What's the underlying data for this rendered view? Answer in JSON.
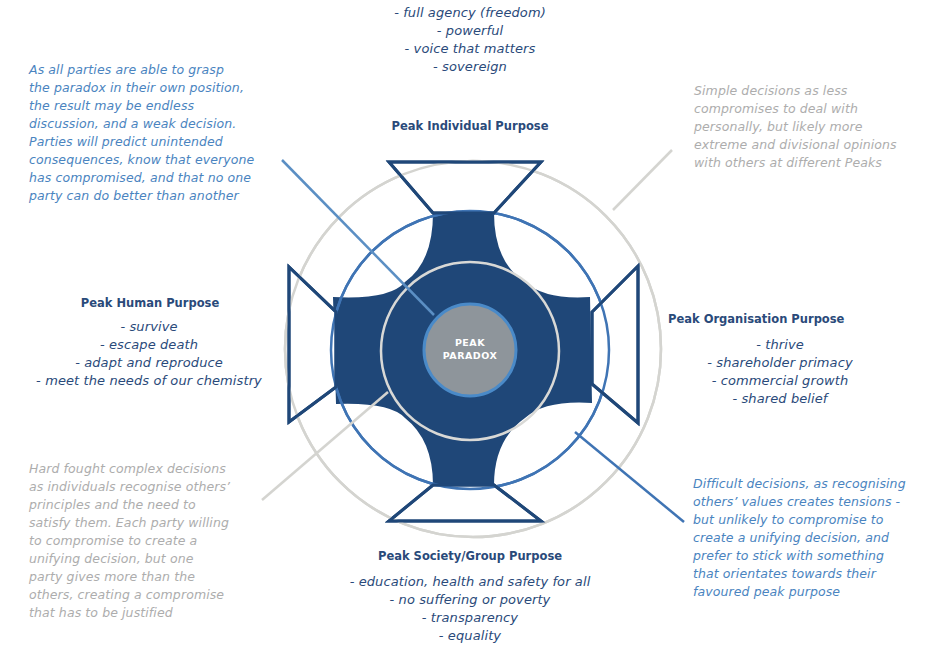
{
  "colors": {
    "navy": "#1f4778",
    "mid_blue": "#3f74b4",
    "light_blue_line": "#5b8fc4",
    "grey_ring": "#d4d4d0",
    "center_fill": "#8e959b",
    "blue_note_text": "#4a84c0",
    "grey_note_text": "#adadad",
    "peak_text": "#2a4a7a"
  },
  "center": {
    "line1": "PEAK",
    "line2": "PARADOX"
  },
  "peaks": {
    "individual": {
      "title": "Peak Individual Purpose",
      "items": [
        "- full agency (freedom)",
        "- powerful",
        "- voice that matters",
        "- sovereign"
      ]
    },
    "human": {
      "title": "Peak Human Purpose",
      "items": [
        "- survive",
        "- escape death",
        "- adapt and reproduce",
        "- meet the needs of our chemistry"
      ]
    },
    "organisation": {
      "title": "Peak Organisation Purpose",
      "items": [
        "- thrive",
        "- shareholder primacy",
        "- commercial growth",
        "- shared belief"
      ]
    },
    "society": {
      "title": "Peak Society/Group Purpose",
      "items": [
        "- education, health and safety for all",
        "- no suffering or poverty",
        "- transparency",
        "- equality"
      ]
    }
  },
  "notes": {
    "top_left": {
      "lines": [
        "As all parties are able to grasp",
        "the paradox in their own position,",
        "the result may be endless",
        "discussion, and a weak decision.",
        "Parties will predict unintended",
        "consequences, know that everyone",
        "has compromised, and that no one",
        "party can do better than another"
      ]
    },
    "top_right": {
      "lines": [
        "Simple decisions as less",
        "compromises to deal with",
        "personally, but likely more",
        "extreme and divisional opinions",
        "with others at different Peaks"
      ]
    },
    "bottom_left": {
      "lines": [
        "Hard fought complex decisions",
        "as individuals recognise others’",
        "principles and the need to",
        "satisfy them. Each party willing",
        "to compromise to create a",
        "unifying decision, but one",
        "party gives more than the",
        "others, creating a compromise",
        "that has to be justified"
      ]
    },
    "bottom_right": {
      "lines": [
        "Difficult decisions, as recognising",
        "others’ values creates tensions -",
        "but unlikely to compromise to",
        "create a unifying decision, and",
        "prefer to stick with something",
        "that orientates towards their",
        "favoured peak purpose"
      ]
    }
  }
}
